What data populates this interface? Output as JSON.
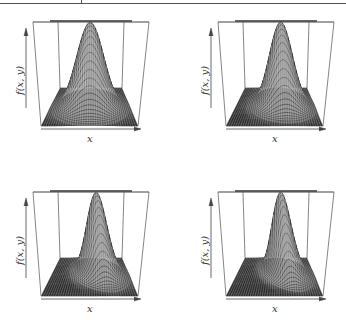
{
  "figure": {
    "panels": [
      {
        "id": "p1",
        "xlabel": "x",
        "ylabel": "f(x, y)",
        "skew": 0.0
      },
      {
        "id": "p2",
        "xlabel": "x",
        "ylabel": "f(x, y)",
        "skew": 0.35
      },
      {
        "id": "p3",
        "xlabel": "x",
        "ylabel": "f(x, y)",
        "skew": 0.7
      },
      {
        "id": "p4",
        "xlabel": "x",
        "ylabel": "f(x, y)",
        "skew": 1.0
      }
    ]
  },
  "chart_data": [
    {
      "type": "surface",
      "title": "",
      "xlabel": "x",
      "ylabel": "f(x, y)",
      "description": "Symmetric bivariate density surface (wireframe perspective plot)",
      "grid": false
    },
    {
      "type": "surface",
      "title": "",
      "xlabel": "x",
      "ylabel": "f(x, y)",
      "description": "Slightly skewed bivariate density surface (wireframe perspective plot)",
      "grid": false
    },
    {
      "type": "surface",
      "title": "",
      "xlabel": "x",
      "ylabel": "f(x, y)",
      "description": "Moderately skewed bivariate density surface (wireframe perspective plot)",
      "grid": false
    },
    {
      "type": "surface",
      "title": "",
      "xlabel": "x",
      "ylabel": "f(x, y)",
      "description": "Strongly skewed bivariate density surface (wireframe perspective plot)",
      "grid": false
    }
  ]
}
